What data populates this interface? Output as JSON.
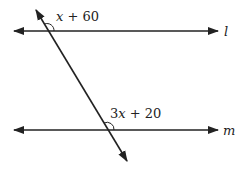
{
  "diagram": {
    "type": "parallel lines cut by a transversal",
    "lines": [
      {
        "name": "l",
        "label": "l",
        "y": 31
      },
      {
        "name": "m",
        "label": "m",
        "y": 130
      }
    ],
    "transversal": {
      "x1": 36,
      "y1": 10,
      "x2": 127,
      "y2": 161
    },
    "angles": [
      {
        "at": "l",
        "expression_var": "x",
        "expression_rest": " + 60",
        "full": "x + 60"
      },
      {
        "at": "m",
        "expression_coef": "3",
        "expression_var": "x",
        "expression_rest": " + 20",
        "full": "3x + 20"
      }
    ],
    "stroke_color": "#222222"
  }
}
